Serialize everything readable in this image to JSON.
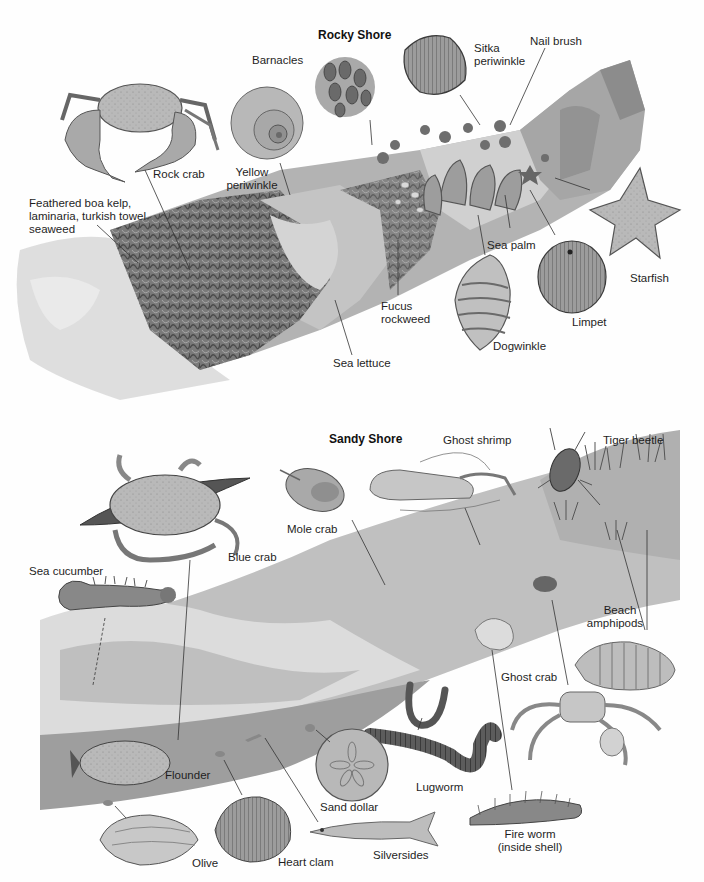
{
  "sections": {
    "rocky": {
      "title": "Rocky Shore",
      "labels": {
        "barnacles": "Barnacles",
        "sitka": "Sitka\nperiwinkle",
        "sitka_l1": "Sitka",
        "sitka_l2": "periwinkle",
        "nail_brush": "Nail brush",
        "rock_crab": "Rock crab",
        "yellow_l1": "Yellow",
        "yellow_l2": "periwinkle",
        "kelp_l1": "Feathered boa kelp,",
        "kelp_l2": "laminaria, turkish towel",
        "kelp_l3": "seaweed",
        "sea_palm": "Sea palm",
        "starfish": "Starfish",
        "limpet": "Limpet",
        "fucus_l1": "Fucus",
        "fucus_l2": "rockweed",
        "dogwinkle": "Dogwinkle",
        "sea_lettuce": "Sea lettuce"
      }
    },
    "sandy": {
      "title": "Sandy Shore",
      "labels": {
        "ghost_shrimp": "Ghost shrimp",
        "tiger_beetle": "Tiger beetle",
        "mole_crab": "Mole crab",
        "blue_crab": "Blue crab",
        "sea_cucumber": "Sea cucumber",
        "beach_l1": "Beach",
        "beach_l2": "amphipods",
        "ghost_crab": "Ghost crab",
        "flounder": "Flounder",
        "sand_dollar": "Sand dollar",
        "lugworm": "Lugworm",
        "fire_l1": "Fire worm",
        "fire_l2": "(inside shell)",
        "olive": "Olive",
        "heart_clam": "Heart clam",
        "silversides": "Silversides"
      }
    }
  },
  "colors": {
    "ink": "#1e1e1e",
    "rock_dark": "#6a6a6a",
    "rock_mid": "#9a9a9a",
    "rock_light": "#cfcfcf",
    "sand": "#bdbdbd",
    "water": "#a8a8a8"
  }
}
